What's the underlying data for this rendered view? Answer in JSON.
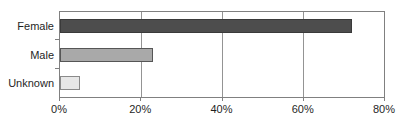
{
  "chart_data": {
    "type": "bar",
    "orientation": "horizontal",
    "title": "",
    "xlabel": "",
    "ylabel": "",
    "categories": [
      "Female",
      "Male",
      "Unknown"
    ],
    "values": [
      72,
      23,
      5
    ],
    "value_unit": "%",
    "xlim": [
      0,
      80
    ],
    "x_tick_values": [
      0,
      20,
      40,
      60,
      80
    ],
    "x_tick_labels": [
      "0%",
      "20%",
      "40%",
      "60%",
      "80%"
    ],
    "grid": "vertical gridlines at each x tick",
    "legend": "none",
    "colors": {
      "bar_fills": [
        "#4d4d4d",
        "#a9a9a9",
        "#e7e7e7"
      ],
      "bar_borders": [
        "#3a3a3a",
        "#565656",
        "#8a8a8a"
      ],
      "plot_border": "#808080",
      "gridline": "#949494",
      "text": "#1f1f1f",
      "background": "#ffffff"
    }
  }
}
